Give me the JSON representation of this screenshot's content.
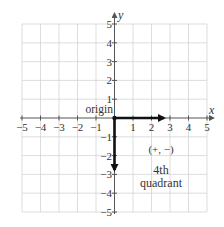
{
  "diagram": {
    "type": "coordinate-plane",
    "x_axis_label": "x",
    "y_axis_label": "y",
    "x_range": [
      -5,
      5
    ],
    "y_range": [
      -5,
      5
    ],
    "x_ticks": [
      "−5",
      "−4",
      "−3",
      "−2",
      "−1",
      "1",
      "2",
      "3",
      "4",
      "5"
    ],
    "y_ticks": [
      "5",
      "4",
      "3",
      "2",
      "1",
      "−1",
      "−2",
      "−3",
      "−4",
      "−5"
    ],
    "origin_label": "origin",
    "sign_label": "(+, −)",
    "quadrant_label_line1": "4th",
    "quadrant_label_line2": "quadrant",
    "vectors": [
      {
        "name": "positive-x-arrow",
        "from": [
          0,
          0
        ],
        "to": [
          2.7,
          0
        ]
      },
      {
        "name": "negative-y-arrow",
        "from": [
          0,
          0
        ],
        "to": [
          0,
          -2.8
        ]
      }
    ],
    "colors": {
      "grid": "#d0d0d0",
      "axis": "#555555",
      "arrow": "#111111",
      "text": "#333333"
    }
  }
}
